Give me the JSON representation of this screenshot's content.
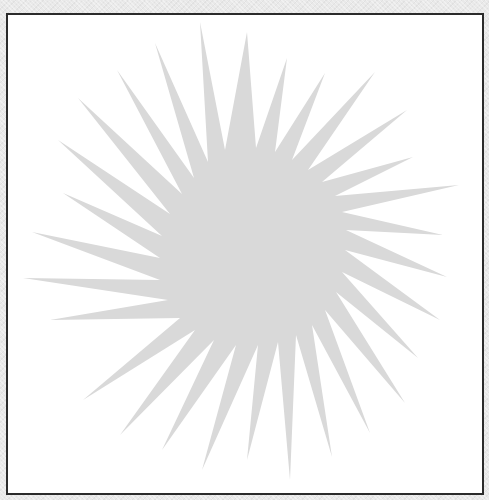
{
  "canvas": {
    "background_color": "#e9e9e9",
    "frame_color": "#ffffff",
    "frame_border_color": "#2b2b2b"
  },
  "shape": {
    "type": "starburst",
    "fill_color": "#d9d9d9",
    "center": [
      245,
      255
    ],
    "spike_count": 28
  }
}
